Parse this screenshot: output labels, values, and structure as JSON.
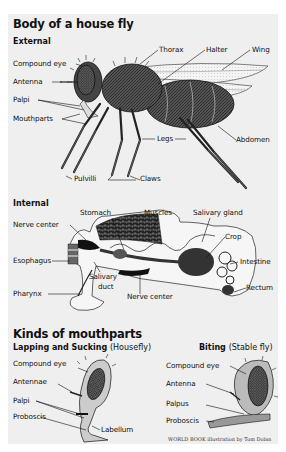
{
  "title": "Body of a house fly",
  "external": {
    "heading": "External",
    "labels": {
      "thorax": "Thorax",
      "halter": "Halter",
      "wing": "Wing",
      "compound_eye": "Compound eye",
      "antenna": "Antenna",
      "palpi": "Palpi",
      "mouthparts": "Mouthparts",
      "legs": "Legs",
      "abdomen": "Abdomen",
      "pulvilli": "Pulvilli",
      "claws": "Claws"
    }
  },
  "internal": {
    "heading": "Internal",
    "labels": {
      "nerve_center_top": "Nerve center",
      "stomach": "Stomach",
      "muscles": "Muscles",
      "salivary_gland": "Salivary gland",
      "crop": "Crop",
      "esophagus": "Esophagus",
      "intestine": "Intestine",
      "salivary_duct_1": "Salivary",
      "salivary_duct_2": "duct",
      "pharynx": "Pharynx",
      "nerve_center_bottom": "Nerve center",
      "rectum": "Rectum"
    }
  },
  "mouthparts": {
    "heading": "Kinds of mouthparts",
    "lapping": {
      "heading": "Lapping and Sucking",
      "paren": "(Housefly)",
      "labels": {
        "compound_eye": "Compound eye",
        "antennae": "Antennae",
        "palpi": "Palpi",
        "proboscis": "Proboscis",
        "labellum": "Labellum"
      }
    },
    "biting": {
      "heading": "Biting",
      "paren": "(Stable fly)",
      "labels": {
        "compound_eye": "Compound eye",
        "antenna": "Antenna",
        "palpus": "Palpus",
        "proboscis": "Proboscis"
      }
    }
  },
  "credit": "WORLD BOOK illustration by Tom Dolan"
}
